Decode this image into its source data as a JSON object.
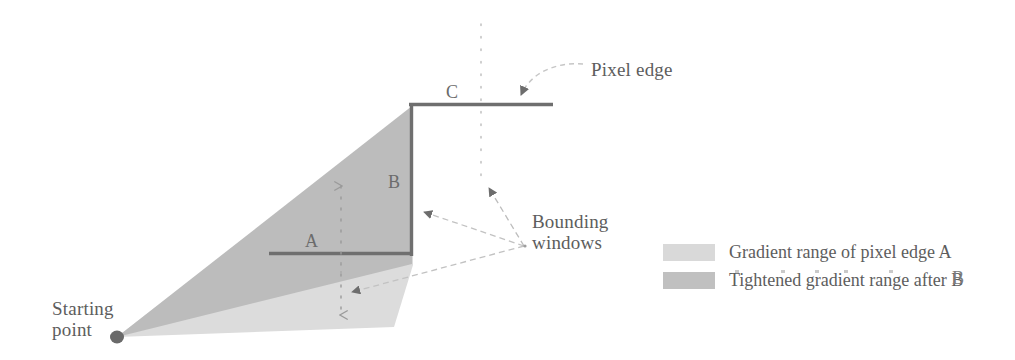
{
  "figure": {
    "kind": "technical-diagram",
    "background_color": "#ffffff",
    "labels": {
      "starting_point": "Starting\npoint",
      "pixel_edge": "Pixel edge",
      "bounding_windows": "Bounding\nwindows",
      "edge_a": "A",
      "edge_b": "B",
      "edge_c": "C"
    }
  },
  "legend": {
    "entries": [
      {
        "swatch_color": "#d9d9d9",
        "label": "Gradient range of pixel edge A"
      },
      {
        "swatch_color": "#c0c0c0",
        "label": "Tightened gradient range after B"
      }
    ],
    "stray_mark": "B"
  },
  "colors": {
    "cone_wide": "#d9d9d9",
    "cone_tight": "#bdbdbd",
    "ink": "#5d5d5d",
    "edge_line": "#6f6f6f",
    "dotted": "#c8c8c8",
    "dot_marker": "#6a6a6a"
  },
  "geometry": {
    "starting_point": {
      "x": 117,
      "y": 337
    },
    "pixel_edge_A": {
      "x1": 270,
      "y1": 253,
      "x2": 413,
      "y2": 253
    },
    "pixel_edge_B": {
      "x1": 412,
      "y1": 105,
      "x2": 412,
      "y2": 254
    },
    "pixel_edge_C": {
      "x1": 410,
      "y1": 104,
      "x2": 553,
      "y2": 104
    },
    "cone_wide_points": "117,337 413,265 413,105",
    "cone_tight_points": "117,337 412,264 412,105",
    "vertical_dotted_line": {
      "x": 481,
      "y1": 24,
      "y2": 190
    },
    "bounding_window_left": {
      "x": 341,
      "y_top": 180,
      "y_bottom": 322
    },
    "leader_origin": {
      "x": 524,
      "y": 246
    }
  }
}
